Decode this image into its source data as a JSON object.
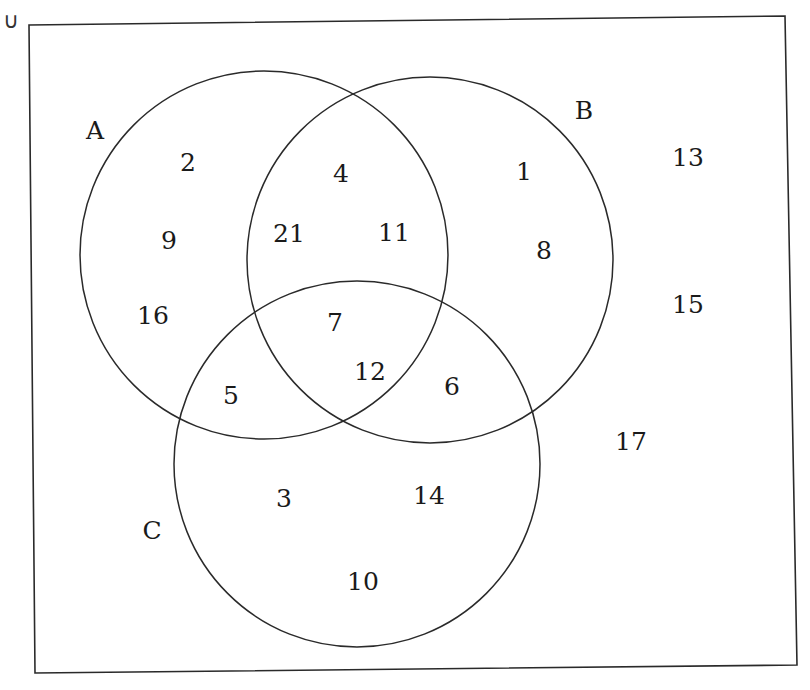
{
  "diagram": {
    "type": "venn",
    "universal_symbol": "∪",
    "line_color": "#2a2a2a",
    "sets": [
      {
        "id": "A",
        "label": "A"
      },
      {
        "id": "B",
        "label": "B"
      },
      {
        "id": "C",
        "label": "C"
      }
    ],
    "regions": [
      {
        "id": "A_only",
        "sets": [
          "A"
        ],
        "elements": [
          "2",
          "9",
          "16"
        ]
      },
      {
        "id": "B_only",
        "sets": [
          "B"
        ],
        "elements": [
          "1",
          "8"
        ]
      },
      {
        "id": "C_only",
        "sets": [
          "C"
        ],
        "elements": [
          "3",
          "14",
          "10"
        ]
      },
      {
        "id": "A_and_B_only",
        "sets": [
          "A",
          "B"
        ],
        "elements": [
          "4",
          "21",
          "11"
        ]
      },
      {
        "id": "A_and_C_only",
        "sets": [
          "A",
          "C"
        ],
        "elements": [
          "5"
        ]
      },
      {
        "id": "B_and_C_only",
        "sets": [
          "B",
          "C"
        ],
        "elements": [
          "6"
        ]
      },
      {
        "id": "A_B_C",
        "sets": [
          "A",
          "B",
          "C"
        ],
        "elements": [
          "7",
          "12"
        ]
      },
      {
        "id": "outside",
        "sets": [],
        "elements": [
          "13",
          "15",
          "17"
        ]
      }
    ]
  }
}
